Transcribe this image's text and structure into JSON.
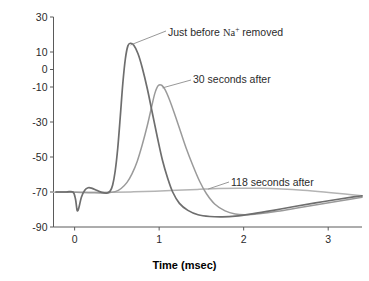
{
  "figure": {
    "caption_fragment": ""
  },
  "chart_data": {
    "type": "line",
    "title": "",
    "xlabel": "Time (msec)",
    "ylabel": "Membrane potential (mV)",
    "xlim": [
      -0.25,
      3.4
    ],
    "ylim": [
      -90,
      30
    ],
    "xticks": [
      0,
      1,
      2,
      3
    ],
    "xticklabels": [
      "0",
      "1",
      "2",
      "3"
    ],
    "yticks": [
      30,
      10,
      0,
      -10,
      -30,
      -50,
      -70,
      -90
    ],
    "yticklabels": [
      "30",
      "10",
      "0",
      "-10",
      "-30",
      "-50",
      "-70",
      "-90"
    ],
    "grid": false,
    "legend": "annotations-inline",
    "resting_potential": -70,
    "series": [
      {
        "name": "Just before Na+ removed",
        "label_html": "Just before Na<sup>+</sup> removed",
        "color": "#6e6e6e",
        "peak_mV": 15,
        "peak_time_msec": 0.62,
        "undershoot_mV": -84,
        "undershoot_time_msec": 1.75,
        "points": [
          [
            -0.22,
            -70.0
          ],
          [
            -0.1,
            -70.0
          ],
          [
            -0.02,
            -70.0
          ],
          [
            0.01,
            -74.0
          ],
          [
            0.03,
            -80.5
          ],
          [
            0.05,
            -79.0
          ],
          [
            0.08,
            -73.0
          ],
          [
            0.12,
            -69.0
          ],
          [
            0.16,
            -67.6
          ],
          [
            0.2,
            -67.8
          ],
          [
            0.26,
            -69.0
          ],
          [
            0.32,
            -70.2
          ],
          [
            0.38,
            -70.6
          ],
          [
            0.42,
            -69.5
          ],
          [
            0.45,
            -66.0
          ],
          [
            0.48,
            -58.0
          ],
          [
            0.51,
            -45.0
          ],
          [
            0.54,
            -27.0
          ],
          [
            0.57,
            -8.0
          ],
          [
            0.6,
            6.0
          ],
          [
            0.63,
            13.5
          ],
          [
            0.66,
            15.0
          ],
          [
            0.7,
            13.8
          ],
          [
            0.75,
            9.0
          ],
          [
            0.8,
            1.0
          ],
          [
            0.86,
            -11.0
          ],
          [
            0.92,
            -25.0
          ],
          [
            0.98,
            -39.0
          ],
          [
            1.04,
            -52.0
          ],
          [
            1.1,
            -62.0
          ],
          [
            1.16,
            -70.0
          ],
          [
            1.24,
            -76.5
          ],
          [
            1.34,
            -80.5
          ],
          [
            1.46,
            -83.0
          ],
          [
            1.6,
            -84.0
          ],
          [
            1.75,
            -84.2
          ],
          [
            1.9,
            -83.8
          ],
          [
            2.1,
            -82.5
          ],
          [
            2.35,
            -80.5
          ],
          [
            2.6,
            -78.3
          ],
          [
            2.85,
            -76.2
          ],
          [
            3.1,
            -74.3
          ],
          [
            3.3,
            -72.8
          ],
          [
            3.4,
            -72.2
          ]
        ]
      },
      {
        "name": "30 seconds after",
        "label_html": "30 seconds after",
        "color": "#9a9a9a",
        "peak_mV": -9,
        "peak_time_msec": 0.98,
        "undershoot_mV": -83,
        "undershoot_time_msec": 1.95,
        "points": [
          [
            -0.22,
            -70.0
          ],
          [
            -0.05,
            -70.0
          ],
          [
            0.02,
            -70.2
          ],
          [
            0.1,
            -70.3
          ],
          [
            0.2,
            -70.4
          ],
          [
            0.3,
            -70.5
          ],
          [
            0.4,
            -70.4
          ],
          [
            0.48,
            -69.8
          ],
          [
            0.55,
            -68.0
          ],
          [
            0.62,
            -64.5
          ],
          [
            0.68,
            -59.5
          ],
          [
            0.74,
            -52.5
          ],
          [
            0.8,
            -43.0
          ],
          [
            0.86,
            -32.0
          ],
          [
            0.91,
            -21.5
          ],
          [
            0.95,
            -13.5
          ],
          [
            0.99,
            -9.2
          ],
          [
            1.03,
            -9.0
          ],
          [
            1.07,
            -11.5
          ],
          [
            1.12,
            -17.0
          ],
          [
            1.18,
            -25.0
          ],
          [
            1.25,
            -35.0
          ],
          [
            1.32,
            -45.0
          ],
          [
            1.4,
            -55.0
          ],
          [
            1.48,
            -64.0
          ],
          [
            1.56,
            -71.0
          ],
          [
            1.66,
            -77.0
          ],
          [
            1.78,
            -80.8
          ],
          [
            1.9,
            -82.6
          ],
          [
            2.02,
            -83.0
          ],
          [
            2.18,
            -82.4
          ],
          [
            2.4,
            -81.0
          ],
          [
            2.65,
            -79.0
          ],
          [
            2.9,
            -77.0
          ],
          [
            3.15,
            -75.0
          ],
          [
            3.4,
            -73.0
          ]
        ]
      },
      {
        "name": "118 seconds after",
        "label_html": "118 seconds after",
        "color": "#b4b4b4",
        "peak_mV": -67.8,
        "peak_time_msec": 1.85,
        "points": [
          [
            -0.25,
            -70.2
          ],
          [
            0.0,
            -70.2
          ],
          [
            0.2,
            -70.2
          ],
          [
            0.45,
            -70.1
          ],
          [
            0.7,
            -69.9
          ],
          [
            0.95,
            -69.5
          ],
          [
            1.2,
            -69.0
          ],
          [
            1.45,
            -68.5
          ],
          [
            1.7,
            -68.0
          ],
          [
            1.95,
            -67.8
          ],
          [
            2.2,
            -67.9
          ],
          [
            2.45,
            -68.3
          ],
          [
            2.7,
            -69.0
          ],
          [
            2.95,
            -70.0
          ],
          [
            3.2,
            -71.2
          ],
          [
            3.4,
            -72.2
          ]
        ]
      }
    ],
    "annotations": [
      {
        "name": "annotation-just-before",
        "text": "Just before Na+ removed",
        "leader_from_msec": 0.66,
        "leader_from_mV": 14.0
      },
      {
        "name": "annotation-30-seconds",
        "text": "30 seconds after",
        "leader_from_msec": 1.04,
        "leader_from_mV": -10.5
      },
      {
        "name": "annotation-118-seconds",
        "text": "118 seconds after",
        "leader_from_msec": 1.58,
        "leader_from_mV": -68.3
      }
    ]
  }
}
